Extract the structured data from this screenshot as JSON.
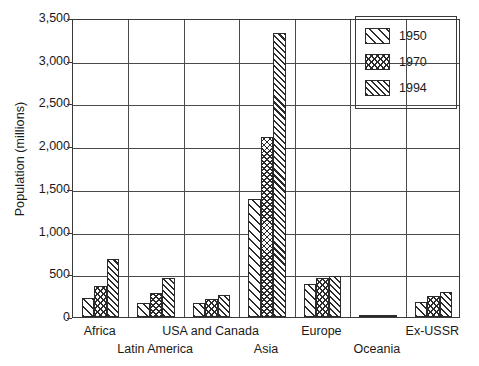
{
  "chart_data": {
    "type": "bar",
    "title": "",
    "xlabel": "",
    "ylabel": "Population (millions)",
    "ylim": [
      0,
      3500
    ],
    "ytick_values": [
      0,
      500,
      1000,
      1500,
      2000,
      2500,
      3000,
      3500
    ],
    "ytick_labels": [
      "0",
      "500",
      "1,000",
      "1,500",
      "2,000",
      "2,500",
      "3,000",
      "3,500"
    ],
    "grid": "horizontal",
    "legend_position": "top-right",
    "categories": [
      "Africa",
      "Latin America",
      "USA and Canada",
      "Asia",
      "Europe",
      "Oceania",
      "Ex-USSR"
    ],
    "series": [
      {
        "name": "1950",
        "pattern": "diagonal-hatch",
        "values": [
          222,
          165,
          166,
          1377,
          392,
          13,
          180
        ]
      },
      {
        "name": "1970",
        "pattern": "cross-hatch",
        "values": [
          362,
          284,
          214,
          2102,
          460,
          19,
          243
        ]
      },
      {
        "name": "1994",
        "pattern": "dense-diagonal-hatch",
        "values": [
          682,
          458,
          262,
          3330,
          480,
          28,
          294
        ]
      }
    ]
  },
  "axis": {
    "y_title": "Population (millions)"
  },
  "legend": {
    "entries": [
      {
        "label": "1950"
      },
      {
        "label": "1970"
      },
      {
        "label": "1994"
      }
    ]
  },
  "colors": {
    "axis": "#3a3a3a",
    "grid": "#4a4a4a",
    "hatch": "#2b2b2b",
    "background": "#ffffff"
  }
}
